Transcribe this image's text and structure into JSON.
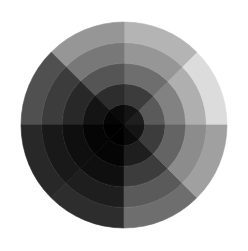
{
  "chart_data": {
    "type": "heatmap",
    "subtype": "polar",
    "title": "",
    "xlabel": "",
    "ylabel": "",
    "grid": false,
    "legend": null,
    "colormap": "grayscale",
    "center": [
      124,
      125
    ],
    "radius": 103,
    "rings": 5,
    "sectors_deg": [
      [
        0,
        45
      ],
      [
        45,
        90
      ],
      [
        90,
        135
      ],
      [
        135,
        180
      ],
      [
        180,
        225
      ],
      [
        225,
        270
      ],
      [
        270,
        315
      ],
      [
        315,
        360
      ]
    ],
    "values": [
      [
        30,
        90,
        130,
        175,
        220
      ],
      [
        20,
        60,
        110,
        150,
        180
      ],
      [
        10,
        45,
        85,
        120,
        150
      ],
      [
        5,
        20,
        40,
        60,
        80
      ],
      [
        0,
        5,
        15,
        25,
        40
      ],
      [
        0,
        5,
        15,
        30,
        45
      ],
      [
        10,
        30,
        60,
        90,
        110
      ],
      [
        20,
        60,
        100,
        140,
        160
      ]
    ],
    "value_range": [
      0,
      255
    ]
  }
}
